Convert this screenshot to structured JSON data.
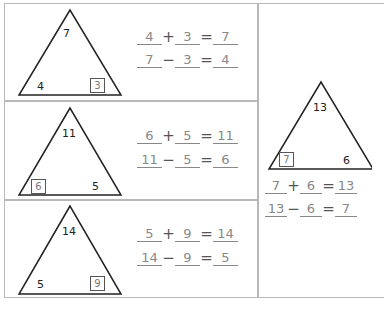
{
  "worksheet": {
    "title": "Fact Families Triangles",
    "colors": {
      "border": "#b8b8b8",
      "answer_text": "#888888",
      "printed_text": "#222222"
    },
    "problems": [
      {
        "top": "7",
        "left": "4",
        "right": "3",
        "boxed": "right",
        "add": {
          "a": "4",
          "op": "+",
          "b": "3",
          "eq": "=",
          "c": "7"
        },
        "sub": {
          "a": "7",
          "op": "−",
          "b": "3",
          "eq": "=",
          "c": "4"
        }
      },
      {
        "top": "11",
        "left": "6",
        "right": "5",
        "boxed": "left",
        "add": {
          "a": "6",
          "op": "+",
          "b": "5",
          "eq": "=",
          "c": "11"
        },
        "sub": {
          "a": "11",
          "op": "−",
          "b": "5",
          "eq": "=",
          "c": "6"
        }
      },
      {
        "top": "14",
        "left": "5",
        "right": "9",
        "boxed": "right",
        "add": {
          "a": "5",
          "op": "+",
          "b": "9",
          "eq": "=",
          "c": "14"
        },
        "sub": {
          "a": "14",
          "op": "−",
          "b": "9",
          "eq": "=",
          "c": "5"
        }
      },
      {
        "top": "13",
        "left": "7",
        "right": "6",
        "boxed": "left",
        "add": {
          "a": "7",
          "op": "+",
          "b": "6",
          "eq": "=",
          "c": "13"
        },
        "sub": {
          "a": "13",
          "op": "−",
          "b": "6",
          "eq": "=",
          "c": "7"
        }
      }
    ]
  }
}
